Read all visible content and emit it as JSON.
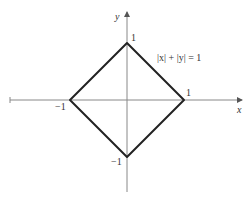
{
  "figure": {
    "equation": "|x| + |y| = 1",
    "x_axis_label": "x",
    "y_axis_label": "y",
    "vertex_labels": {
      "top": "1",
      "right": "1",
      "left": "−1",
      "bottom": "−1"
    },
    "vertices": [
      [
        0,
        1
      ],
      [
        1,
        0
      ],
      [
        0,
        -1
      ],
      [
        -1,
        0
      ]
    ],
    "colors": {
      "shape": "#222222",
      "axes": "#888888"
    }
  }
}
